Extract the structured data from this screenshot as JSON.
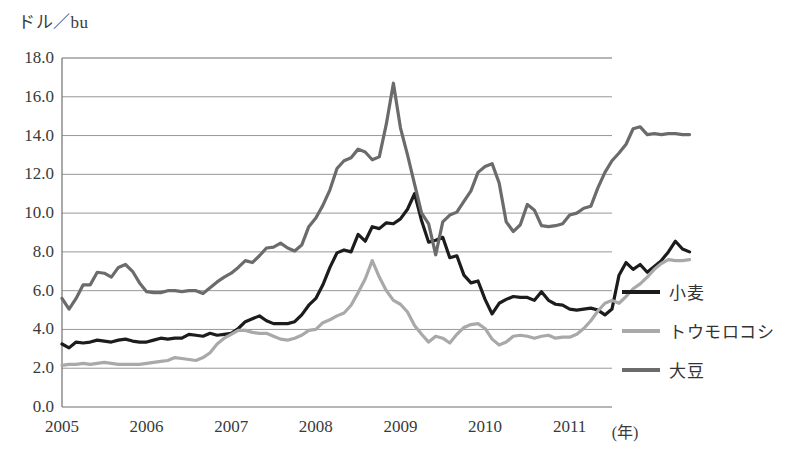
{
  "chart_data": {
    "type": "line",
    "title": "",
    "subtitle": "",
    "xlabel": "(年)",
    "ylabel": "ドル／bu",
    "ylim": [
      0.0,
      18.0
    ],
    "xlim": [
      2005.0,
      2011.5
    ],
    "grid": true,
    "legend_position": "right",
    "y_ticks": [
      "0.0",
      "2.0",
      "4.0",
      "6.0",
      "8.0",
      "10.0",
      "12.0",
      "14.0",
      "16.0",
      "18.0"
    ],
    "y_tick_values": [
      0.0,
      2.0,
      4.0,
      6.0,
      8.0,
      10.0,
      12.0,
      14.0,
      16.0,
      18.0
    ],
    "x_ticks": [
      "2005",
      "2006",
      "2007",
      "2008",
      "2009",
      "2010",
      "2011"
    ],
    "x_tick_values": [
      2005,
      2006,
      2007,
      2008,
      2009,
      2010,
      2011
    ],
    "x_start": 2005.0,
    "x_step": 0.08333,
    "series": [
      {
        "name": "小麦",
        "color": "#1c1c1c",
        "width": 3.2,
        "values": [
          3.25,
          3.05,
          3.35,
          3.3,
          3.35,
          3.45,
          3.4,
          3.35,
          3.45,
          3.5,
          3.4,
          3.35,
          3.35,
          3.45,
          3.55,
          3.5,
          3.55,
          3.55,
          3.75,
          3.7,
          3.65,
          3.8,
          3.7,
          3.75,
          3.8,
          4.05,
          4.4,
          4.55,
          4.7,
          4.45,
          4.3,
          4.3,
          4.3,
          4.4,
          4.75,
          5.25,
          5.6,
          6.3,
          7.2,
          7.95,
          8.1,
          8.0,
          8.9,
          8.55,
          9.3,
          9.2,
          9.5,
          9.45,
          9.7,
          10.2,
          11.0,
          9.6,
          8.5,
          8.6,
          8.75,
          7.7,
          7.8,
          6.8,
          6.4,
          6.5,
          5.55,
          4.8,
          5.35,
          5.55,
          5.7,
          5.65,
          5.65,
          5.5,
          5.95,
          5.5,
          5.3,
          5.25,
          5.05,
          5.0,
          5.05,
          5.1,
          5.0,
          4.75,
          5.05,
          6.8,
          7.45,
          7.1,
          7.35,
          6.95,
          7.25,
          7.55,
          8.0,
          8.55,
          8.15,
          8.0
        ]
      },
      {
        "name": "トウモロコシ",
        "color": "#a9a9a9",
        "width": 3.2,
        "values": [
          2.15,
          2.2,
          2.2,
          2.25,
          2.2,
          2.25,
          2.3,
          2.25,
          2.2,
          2.2,
          2.2,
          2.2,
          2.25,
          2.3,
          2.35,
          2.4,
          2.55,
          2.5,
          2.45,
          2.4,
          2.55,
          2.8,
          3.25,
          3.55,
          3.75,
          3.95,
          3.95,
          3.85,
          3.8,
          3.8,
          3.65,
          3.5,
          3.45,
          3.55,
          3.7,
          3.95,
          4.0,
          4.35,
          4.5,
          4.7,
          4.85,
          5.25,
          5.9,
          6.6,
          7.55,
          6.7,
          6.0,
          5.5,
          5.3,
          4.9,
          4.2,
          3.75,
          3.35,
          3.65,
          3.55,
          3.3,
          3.75,
          4.1,
          4.25,
          4.3,
          4.05,
          3.5,
          3.2,
          3.35,
          3.65,
          3.7,
          3.65,
          3.55,
          3.65,
          3.7,
          3.55,
          3.6,
          3.6,
          3.75,
          4.05,
          4.45,
          4.95,
          5.35,
          5.5,
          5.35,
          5.7,
          6.1,
          6.35,
          6.7,
          7.1,
          7.4,
          7.6,
          7.55,
          7.55,
          7.6
        ]
      },
      {
        "name": "大豆",
        "color": "#6b6b6b",
        "width": 3.2,
        "values": [
          5.6,
          5.05,
          5.6,
          6.3,
          6.3,
          6.95,
          6.9,
          6.7,
          7.2,
          7.35,
          7.0,
          6.4,
          5.95,
          5.9,
          5.9,
          6.0,
          6.0,
          5.95,
          6.0,
          6.0,
          5.85,
          6.15,
          6.45,
          6.7,
          6.9,
          7.2,
          7.55,
          7.45,
          7.8,
          8.2,
          8.25,
          8.45,
          8.2,
          8.05,
          8.35,
          9.3,
          9.75,
          10.4,
          11.2,
          12.3,
          12.7,
          12.85,
          13.3,
          13.15,
          12.75,
          12.9,
          14.6,
          16.7,
          14.4,
          13.0,
          11.5,
          10.0,
          9.45,
          7.85,
          9.55,
          9.9,
          10.05,
          10.6,
          11.15,
          12.1,
          12.4,
          12.55,
          11.55,
          9.55,
          9.05,
          9.4,
          10.45,
          10.15,
          9.35,
          9.3,
          9.35,
          9.45,
          9.9,
          10.0,
          10.25,
          10.35,
          11.3,
          12.1,
          12.7,
          13.1,
          13.55,
          14.35,
          14.45,
          14.05,
          14.1,
          14.05,
          14.1,
          14.1,
          14.05,
          14.05
        ]
      }
    ]
  },
  "legend": {
    "items": [
      {
        "label": "小麦",
        "color": "#1c1c1c"
      },
      {
        "label": "トウモロコシ",
        "color": "#a9a9a9"
      },
      {
        "label": "大豆",
        "color": "#6b6b6b"
      }
    ]
  },
  "axis": {
    "unit_label": "ドル／bu",
    "x_unit_label": "(年)"
  }
}
